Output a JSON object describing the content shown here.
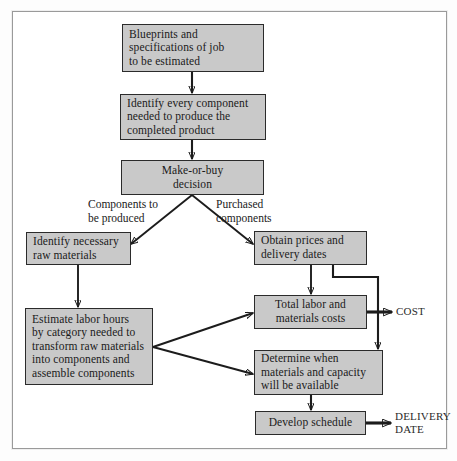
{
  "diagram": {
    "title_present": false,
    "background_color": "#ffffff",
    "box_fill_color": "#c9c9c9",
    "box_border_color": "#2b2b2b",
    "line_color": "#1c1c1c",
    "nodes": [
      {
        "id": "blueprints",
        "label": "Blueprints and\nspecifications of job\nto be estimated"
      },
      {
        "id": "identify",
        "label": "Identify every component\nneeded to produce the\ncompleted product"
      },
      {
        "id": "makeorbuy",
        "label": "Make-or-buy\ndecision"
      },
      {
        "id": "rawmaterials",
        "label": "Identify necessary\nraw materials"
      },
      {
        "id": "obtainprices",
        "label": "Obtain prices and\ndelivery dates"
      },
      {
        "id": "estimate",
        "label": "Estimate labor hours\nby category needed to\ntransform raw materials\ninto components and\nassemble components"
      },
      {
        "id": "totalcosts",
        "label": "Total labor and\nmaterials costs"
      },
      {
        "id": "determine",
        "label": "Determine when\nmaterials and capacity\nwill be available"
      },
      {
        "id": "schedule",
        "label": "Develop schedule"
      }
    ],
    "edge_labels": [
      {
        "id": "left-branch",
        "label": "Components to\nbe produced"
      },
      {
        "id": "right-branch",
        "label": "Purchased\ncomponents"
      }
    ],
    "outputs": [
      {
        "id": "cost",
        "label": "COST"
      },
      {
        "id": "delivery",
        "label": "DELIVERY\nDATE"
      }
    ]
  }
}
